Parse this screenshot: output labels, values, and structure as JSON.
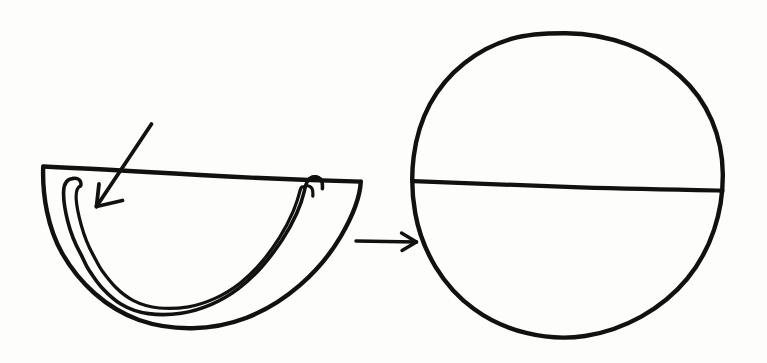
{
  "document": {
    "kind": "hand-drawn-diagram",
    "title": "Half fruit cross-section transforming into whole sphere",
    "background_color": "#fdfdfc",
    "ink_color": "#111110",
    "width": 767,
    "height": 363,
    "text_labels": []
  },
  "figures": [
    {
      "id": "left-figure",
      "name": "half-fruit-cross-section",
      "description": "Hand-drawn semicircular half of a fruit seen in cross-section, with a double-line wavy rind band following the curved edge and a flat chord across the top",
      "parts": [
        {
          "name": "outer-semicircle-outline",
          "stroke_width": 4.2
        },
        {
          "name": "top-chord-line",
          "stroke_width": 4.2
        },
        {
          "name": "rind-outer-wavy-line",
          "stroke_width": 3.4
        },
        {
          "name": "rind-inner-wavy-line",
          "stroke_width": 3.0
        }
      ],
      "bounds": {
        "x": 40,
        "y": 160,
        "width": 325,
        "height": 170
      }
    },
    {
      "id": "right-figure",
      "name": "whole-sphere-bisected",
      "description": "Hand-drawn circle representing the whole sphere, crossed by a single nearly horizontal diameter line",
      "parts": [
        {
          "name": "circle-outline",
          "stroke_width": 4.2
        },
        {
          "name": "horizontal-diameter-line",
          "stroke_width": 4.2
        }
      ],
      "bounds": {
        "x": 412,
        "y": 32,
        "width": 312,
        "height": 306
      }
    }
  ],
  "annotations": [
    {
      "id": "rind-pointer",
      "name": "rind-pointer-arrow",
      "description": "Diagonal arrow drawn from upper right to lower left, crossing the top chord and pointing at the rind band near the left tip",
      "direction": "down-left",
      "from": {
        "x": 151,
        "y": 124
      },
      "to": {
        "x": 95,
        "y": 207
      },
      "stroke_width": 3.6
    },
    {
      "id": "transition",
      "name": "transition-arrow",
      "description": "Horizontal arrow pointing right, linking the half cross-section to the whole sphere",
      "direction": "right",
      "from": {
        "x": 356,
        "y": 241
      },
      "to": {
        "x": 417,
        "y": 242
      },
      "stroke_width": 3.2
    }
  ]
}
